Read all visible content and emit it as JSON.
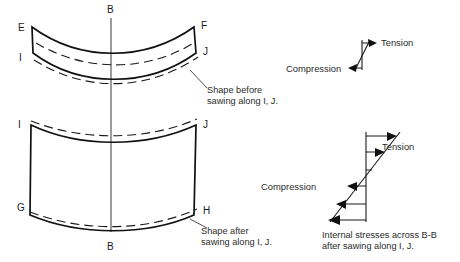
{
  "figure": {
    "background_color": "#ffffff",
    "line_color": "#111111"
  },
  "upper_shape": {
    "name": "beam-before-sawing",
    "vertex_labels": {
      "top_left": "E",
      "top_right": "F",
      "bottom_left": "I",
      "bottom_right": "J"
    },
    "caption": {
      "line1": "Shape before",
      "line2": "sawing along I, J."
    }
  },
  "lower_shape": {
    "name": "beam-after-sawing",
    "vertex_labels": {
      "top_left": "I",
      "top_right": "J",
      "bottom_left": "G",
      "bottom_right": "H"
    },
    "caption": {
      "line1": "Shape after",
      "line2": "sawing along I, J."
    }
  },
  "centerline": {
    "top_label": "B",
    "bottom_label": "B"
  },
  "small_stress_diagram": {
    "name": "stress-before-sawing",
    "tension_label": "Tension",
    "compression_label": "Compression"
  },
  "large_stress_diagram": {
    "name": "stress-after-sawing",
    "tension_label": "Tension",
    "compression_label": "Compression",
    "caption": {
      "line1": "Internal stresses across B-B",
      "line2": "after sawing along I, J."
    }
  }
}
